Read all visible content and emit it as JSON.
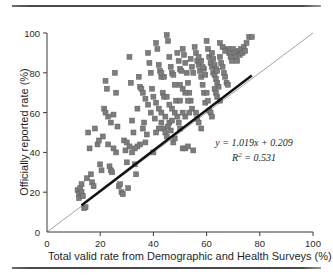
{
  "chart_data": {
    "type": "scatter",
    "title": "",
    "xlabel": "Total valid rate from Demographic and Health Surveys (%)",
    "ylabel": "Officially reported rate (%)",
    "xlim": [
      0,
      100
    ],
    "ylim": [
      0,
      100
    ],
    "xticks": [
      0,
      20,
      40,
      60,
      80,
      100
    ],
    "yticks": [
      0,
      20,
      40,
      60,
      80,
      100
    ],
    "grid": false,
    "legend": "none",
    "marker": {
      "shape": "square",
      "color": "#7d7d7d",
      "size_px": 5
    },
    "annotations": {
      "equation": "y = 1.019x + 0.209",
      "r_squared_label": "R",
      "r_squared_exponent": "2",
      "r_squared_value": " = 0.531"
    },
    "lines": [
      {
        "name": "regression-line",
        "equation": "y = 1.019x + 0.209",
        "slope": 1.019,
        "intercept": 0.209,
        "color": "#111111",
        "width_px": 2.4,
        "x_start": 13,
        "x_end": 77
      },
      {
        "name": "identity-line",
        "equation": "y = x",
        "slope": 1,
        "intercept": 0,
        "color": "#8c8c8c",
        "width_px": 0.8,
        "x_start": 0,
        "x_end": 100
      }
    ],
    "points": [
      [
        11.5,
        21
      ],
      [
        12,
        19
      ],
      [
        12.5,
        22
      ],
      [
        12,
        17
      ],
      [
        13,
        20
      ],
      [
        13.5,
        18
      ],
      [
        13,
        24
      ],
      [
        14,
        12
      ],
      [
        14.5,
        12.5
      ],
      [
        15,
        27
      ],
      [
        16,
        42
      ],
      [
        16.5,
        29
      ],
      [
        17,
        25
      ],
      [
        17.5,
        23
      ],
      [
        15.5,
        50
      ],
      [
        18,
        52
      ],
      [
        19,
        44
      ],
      [
        19.5,
        46
      ],
      [
        20,
        34
      ],
      [
        20.5,
        31
      ],
      [
        21,
        48
      ],
      [
        21.5,
        62
      ],
      [
        22,
        76
      ],
      [
        22.5,
        72
      ],
      [
        23,
        44
      ],
      [
        23.5,
        33
      ],
      [
        24,
        31
      ],
      [
        24.5,
        30
      ],
      [
        25,
        59
      ],
      [
        25.5,
        80
      ],
      [
        26,
        70
      ],
      [
        26.5,
        53
      ],
      [
        27,
        23
      ],
      [
        27.5,
        24
      ],
      [
        28,
        20
      ],
      [
        28.5,
        19
      ],
      [
        29,
        46
      ],
      [
        29.5,
        41
      ],
      [
        30,
        35
      ],
      [
        30.5,
        22
      ],
      [
        31,
        88
      ],
      [
        31.5,
        75
      ],
      [
        32,
        56
      ],
      [
        32.5,
        50
      ],
      [
        33,
        34
      ],
      [
        33.5,
        29
      ],
      [
        34,
        62
      ],
      [
        34.5,
        78
      ],
      [
        35,
        73
      ],
      [
        35.5,
        72
      ],
      [
        36,
        52
      ],
      [
        36.5,
        55
      ],
      [
        37,
        45
      ],
      [
        37.5,
        49
      ],
      [
        38,
        90
      ],
      [
        38.5,
        85
      ],
      [
        39,
        80
      ],
      [
        39.5,
        72
      ],
      [
        40,
        40
      ],
      [
        40.5,
        57
      ],
      [
        41,
        95
      ],
      [
        41.5,
        92
      ],
      [
        42,
        84
      ],
      [
        42.5,
        81
      ],
      [
        43,
        78
      ],
      [
        43.5,
        70
      ],
      [
        44,
        68
      ],
      [
        44.5,
        58
      ],
      [
        45,
        99
      ],
      [
        45.5,
        96
      ],
      [
        46,
        88
      ],
      [
        46.5,
        83
      ],
      [
        47,
        80
      ],
      [
        47.5,
        79
      ],
      [
        48,
        74
      ],
      [
        48.5,
        66
      ],
      [
        44,
        52
      ],
      [
        44.5,
        50
      ],
      [
        45,
        48
      ],
      [
        45.5,
        53
      ],
      [
        46,
        55
      ],
      [
        46.5,
        51
      ],
      [
        47,
        56
      ],
      [
        47.5,
        45
      ],
      [
        48,
        47
      ],
      [
        49,
        90
      ],
      [
        49.5,
        86
      ],
      [
        50,
        82
      ],
      [
        50.5,
        81
      ],
      [
        51,
        92
      ],
      [
        51.5,
        89
      ],
      [
        52,
        85
      ],
      [
        52.5,
        80
      ],
      [
        53,
        75
      ],
      [
        53.5,
        70
      ],
      [
        54,
        66
      ],
      [
        54.5,
        62
      ],
      [
        49,
        58
      ],
      [
        49.5,
        55
      ],
      [
        50,
        52
      ],
      [
        51,
        42
      ],
      [
        52,
        42
      ],
      [
        53,
        43
      ],
      [
        55,
        41
      ],
      [
        55.5,
        93
      ],
      [
        56,
        90
      ],
      [
        56.5,
        86
      ],
      [
        57,
        84
      ],
      [
        57.5,
        81
      ],
      [
        58,
        78
      ],
      [
        58.5,
        74
      ],
      [
        59,
        70
      ],
      [
        59.5,
        65
      ],
      [
        56,
        60
      ],
      [
        56.5,
        57
      ],
      [
        57,
        55
      ],
      [
        58,
        52
      ],
      [
        54,
        87
      ],
      [
        54.5,
        83
      ],
      [
        55,
        80
      ],
      [
        53,
        66
      ],
      [
        53.5,
        60
      ],
      [
        52,
        58
      ],
      [
        51,
        60
      ],
      [
        60,
        96
      ],
      [
        60.5,
        92
      ],
      [
        61,
        88
      ],
      [
        61.5,
        85
      ],
      [
        62,
        83
      ],
      [
        62.5,
        80
      ],
      [
        63,
        79
      ],
      [
        63.5,
        77
      ],
      [
        64,
        75
      ],
      [
        64.5,
        73
      ],
      [
        60,
        70
      ],
      [
        60.5,
        66
      ],
      [
        61,
        61
      ],
      [
        61.5,
        60
      ],
      [
        62,
        58
      ],
      [
        59,
        82
      ],
      [
        59.5,
        79
      ],
      [
        58,
        86
      ],
      [
        58.5,
        83
      ],
      [
        57,
        88
      ],
      [
        62,
        90
      ],
      [
        62.5,
        87
      ],
      [
        63,
        84
      ],
      [
        63.5,
        82
      ],
      [
        64,
        81
      ],
      [
        65,
        88
      ],
      [
        65.5,
        85
      ],
      [
        66,
        83
      ],
      [
        66.5,
        80
      ],
      [
        67,
        78
      ],
      [
        67.5,
        75
      ],
      [
        68,
        74
      ],
      [
        63,
        72
      ],
      [
        63.5,
        70
      ],
      [
        64,
        68
      ],
      [
        65,
        66
      ],
      [
        68,
        92
      ],
      [
        68.5,
        90
      ],
      [
        69,
        88
      ],
      [
        69.5,
        86
      ],
      [
        70,
        92
      ],
      [
        70.5,
        90
      ],
      [
        71,
        88
      ],
      [
        71.5,
        86
      ],
      [
        72,
        91
      ],
      [
        72.5,
        89
      ],
      [
        73,
        92
      ],
      [
        73.5,
        90
      ],
      [
        74,
        93
      ],
      [
        74.5,
        91
      ],
      [
        75,
        95
      ],
      [
        76,
        98
      ],
      [
        77,
        98
      ],
      [
        66,
        93
      ],
      [
        67,
        91
      ],
      [
        65,
        95
      ],
      [
        43,
        60
      ],
      [
        42,
        62
      ],
      [
        41,
        65
      ],
      [
        40,
        68
      ],
      [
        39,
        60
      ],
      [
        38,
        64
      ],
      [
        37,
        67
      ],
      [
        36,
        70
      ],
      [
        35,
        44
      ],
      [
        34,
        43
      ],
      [
        33,
        42
      ],
      [
        43,
        55
      ],
      [
        42,
        52
      ],
      [
        41,
        50
      ],
      [
        30,
        45
      ],
      [
        31,
        43
      ],
      [
        32,
        40
      ],
      [
        26,
        40
      ],
      [
        25,
        42
      ],
      [
        24,
        55
      ],
      [
        23,
        58
      ],
      [
        22,
        60
      ],
      [
        50,
        66
      ],
      [
        48,
        60
      ],
      [
        47,
        62
      ],
      [
        46,
        64
      ],
      [
        45,
        68
      ],
      [
        44,
        78
      ],
      [
        43,
        80
      ],
      [
        52,
        70
      ],
      [
        51,
        72
      ],
      [
        50,
        74
      ]
    ]
  },
  "figure": {
    "top_rule": true,
    "bottom_rule": true
  }
}
